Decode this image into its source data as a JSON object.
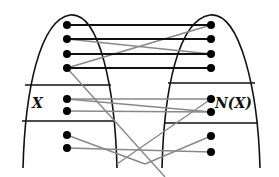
{
  "labels": {
    "left_set": "X",
    "right_set": "N(X)"
  },
  "colors": {
    "background": "#ffffff",
    "outline": "#111111",
    "edge_dark": "#111111",
    "edge_light": "#888888",
    "vertex": "#000000"
  },
  "left_vertices": [
    {
      "id": "L1",
      "x": 67,
      "y": 25
    },
    {
      "id": "L2",
      "x": 67,
      "y": 39
    },
    {
      "id": "L3",
      "x": 67,
      "y": 54
    },
    {
      "id": "L4",
      "x": 67,
      "y": 68
    },
    {
      "id": "L5",
      "x": 67,
      "y": 99,
      "in_set": "X"
    },
    {
      "id": "L6",
      "x": 67,
      "y": 111,
      "in_set": "X"
    },
    {
      "id": "L7",
      "x": 67,
      "y": 135
    },
    {
      "id": "L8",
      "x": 67,
      "y": 148
    }
  ],
  "right_vertices": [
    {
      "id": "R1",
      "x": 211,
      "y": 25
    },
    {
      "id": "R2",
      "x": 211,
      "y": 39
    },
    {
      "id": "R3",
      "x": 211,
      "y": 54
    },
    {
      "id": "R4",
      "x": 211,
      "y": 68
    },
    {
      "id": "R5",
      "x": 211,
      "y": 99,
      "in_set": "N(X)"
    },
    {
      "id": "R6",
      "x": 211,
      "y": 112,
      "in_set": "N(X)"
    },
    {
      "id": "R7",
      "x": 211,
      "y": 136
    },
    {
      "id": "R8",
      "x": 211,
      "y": 152
    }
  ],
  "dark_edges": [
    [
      "L1",
      "R1"
    ],
    [
      "L2",
      "R2"
    ],
    [
      "L3",
      "R3"
    ],
    [
      "L4",
      "R4"
    ]
  ],
  "light_edges": [
    {
      "from": [
        67,
        68
      ],
      "to": [
        211,
        25
      ]
    },
    {
      "from": [
        67,
        39
      ],
      "to": [
        211,
        54
      ]
    },
    {
      "from": [
        67,
        68
      ],
      "to": [
        165,
        177
      ]
    },
    {
      "from": [
        67,
        99
      ],
      "to": [
        211,
        99
      ]
    },
    {
      "from": [
        67,
        99
      ],
      "to": [
        211,
        112
      ]
    },
    {
      "from": [
        67,
        111
      ],
      "to": [
        211,
        112
      ]
    },
    {
      "from": [
        211,
        99
      ],
      "to": [
        117,
        164
      ]
    },
    {
      "from": [
        67,
        135
      ],
      "to": [
        145,
        164
      ]
    },
    {
      "from": [
        145,
        164
      ],
      "to": [
        211,
        136
      ]
    },
    {
      "from": [
        67,
        148
      ],
      "to": [
        211,
        152
      ]
    }
  ],
  "left_shape": {
    "path": "M 23 168 C 25 90, 40 20, 70 15 C 100 12, 115 90, 117 168",
    "dividers": [
      [
        25,
        85,
        111,
        85
      ],
      [
        22,
        121,
        115,
        121
      ]
    ]
  },
  "right_shape": {
    "path": "M 162 168 C 164 90, 178 20, 210 15 C 240 12, 258 90, 260 168",
    "dividers": [
      [
        168,
        83,
        255,
        83
      ],
      [
        165,
        123,
        258,
        123
      ]
    ]
  }
}
